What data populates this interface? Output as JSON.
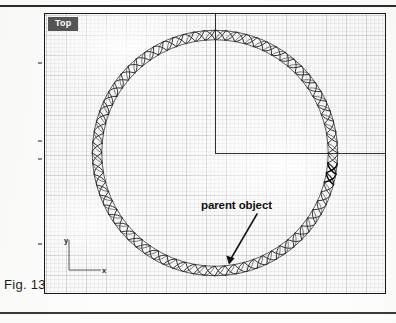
{
  "figure": {
    "caption": "Fig. 13",
    "domain_note": "scanned book figure of a 3D modelling application viewport"
  },
  "viewport": {
    "label": "Top",
    "label_bg_color": "#555555",
    "label_text_color": "#ffffff",
    "border_color": "#1a1a1a",
    "background_color": "#fbfbfa",
    "grid_visible": true,
    "grid_color": "#787d8c"
  },
  "axis_gizmo": {
    "y_label": "y",
    "x_label": "x",
    "color": "#1c1c1c"
  },
  "annotation": {
    "label": "parent object",
    "arrow_color": "#111111",
    "points_to": "single rope segment at bottom of circle"
  },
  "crosshair": {
    "color": "#303030",
    "origin_x": 170,
    "origin_y": 139
  },
  "chart_data": {
    "type": "scatter",
    "title": "Top",
    "xlabel": "x",
    "ylabel": "y",
    "grid": true,
    "legend": "none",
    "annotations": [
      "parent object"
    ],
    "objects": [
      {
        "name": "rope-circle-array",
        "shape": "circle",
        "center_x": 170,
        "center_y": 139,
        "radius": 118,
        "segment_count": 72,
        "stroke_color": "#2a2a2a",
        "description": "array of twisted rope segments placed around a circular path"
      },
      {
        "name": "parent-object-segment",
        "shape": "rope-segment",
        "angle_deg": 96,
        "highlighted": true,
        "stroke_color": "#000000"
      }
    ]
  },
  "ruler": {
    "tick_color": "#8a8a8a",
    "tick_positions_y": [
      62,
      140,
      158,
      243
    ]
  }
}
